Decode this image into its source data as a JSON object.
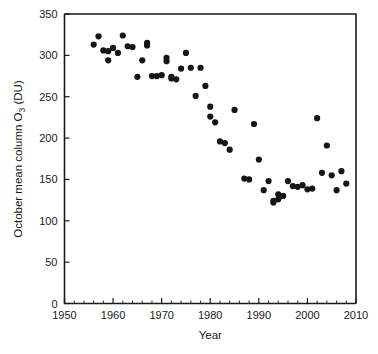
{
  "chart_data": {
    "type": "scatter",
    "title": "",
    "xlabel": "Year",
    "ylabel": "October mean column O3 (DU)",
    "ylabel_parts": {
      "pre": "October mean column O",
      "sub": "3",
      "post": " (DU)"
    },
    "xlim": [
      1950,
      2010
    ],
    "ylim": [
      0,
      350
    ],
    "xticks": [
      1950,
      1960,
      1970,
      1980,
      1990,
      2000,
      2010
    ],
    "xtick_labels": [
      "1950",
      "1960",
      "1970",
      "1980",
      "1990",
      "2000",
      "2010"
    ],
    "yticks": [
      0,
      50,
      100,
      150,
      200,
      250,
      300,
      350
    ],
    "ytick_labels": [
      "0",
      "50",
      "100",
      "150",
      "200",
      "250",
      "300",
      "350"
    ],
    "x_minor_step": 2,
    "grid": false,
    "legend": null,
    "marker": {
      "shape": "circle",
      "color": "#151515",
      "size_px": 5.0
    },
    "x": [
      1956,
      1957,
      1958,
      1959,
      1959,
      1960,
      1961,
      1962,
      1963,
      1964,
      1965,
      1966,
      1967,
      1967,
      1968,
      1969,
      1970,
      1971,
      1971,
      1972,
      1972,
      1973,
      1974,
      1975,
      1976,
      1977,
      1978,
      1979,
      1980,
      1980,
      1981,
      1982,
      1983,
      1984,
      1985,
      1987,
      1988,
      1989,
      1990,
      1991,
      1992,
      1993,
      1993,
      1994,
      1994,
      1995,
      1996,
      1997,
      1998,
      1999,
      2000,
      2001,
      2002,
      2003,
      2004,
      2005,
      2006,
      2007,
      2008
    ],
    "y": [
      313,
      323,
      306,
      305,
      294,
      309,
      303,
      324,
      311,
      310,
      274,
      294,
      315,
      312,
      275,
      275,
      276,
      297,
      293,
      272,
      274,
      271,
      284,
      303,
      285,
      251,
      285,
      263,
      226,
      238,
      219,
      196,
      194,
      186,
      234,
      151,
      150,
      217,
      174,
      137,
      148,
      124,
      122,
      126,
      132,
      130,
      148,
      142,
      141,
      143,
      138,
      139,
      224,
      158,
      191,
      155,
      137,
      160,
      145
    ],
    "n_points": 59,
    "units": "DU",
    "series_name": "October mean column ozone"
  },
  "axes": {
    "y_label_text": "October mean column O",
    "y_label_sub": "3",
    "y_label_suffix": " (DU)",
    "x_label_text": "Year"
  }
}
